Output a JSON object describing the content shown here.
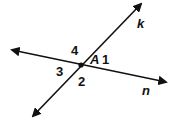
{
  "diagram": {
    "lines": [
      {
        "name": "k",
        "label": "k"
      },
      {
        "name": "n",
        "label": "n"
      }
    ],
    "point": {
      "label": "A"
    },
    "angles": [
      {
        "label": "1"
      },
      {
        "label": "2"
      },
      {
        "label": "3"
      },
      {
        "label": "4"
      }
    ],
    "colors": {
      "stroke": "#111111",
      "background": "#ffffff"
    }
  }
}
